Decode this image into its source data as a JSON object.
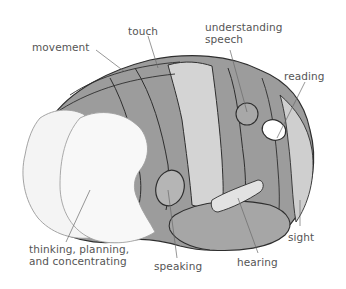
{
  "figure": {
    "colors": {
      "background": "#ffffff",
      "dark_region": "#9c9c9c",
      "light_region": "#cfcfcf",
      "white_region": "#f7f7f7",
      "outline": "#2e2e2e",
      "label_text": "#555555",
      "leader_line": "#6a6a6a"
    }
  },
  "labels": {
    "movement": "movement",
    "touch": "touch",
    "understanding_speech_line1": "understanding",
    "understanding_speech_line2": "speech",
    "reading": "reading",
    "thinking_line1": "thinking, planning,",
    "thinking_line2": "and concentrating",
    "speaking": "speaking",
    "hearing": "hearing",
    "sight": "sight"
  }
}
